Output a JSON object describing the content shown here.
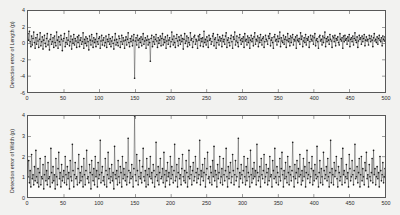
{
  "figure": {
    "background_color": "#f2f2f0",
    "series_color": "#1a1a1a",
    "axis_color": "#585858"
  },
  "chart_data": [
    {
      "type": "line",
      "title": "",
      "subtitle": "",
      "xlabel": "",
      "ylabel": "Detection error of Length (p)",
      "xlim": [
        0,
        500
      ],
      "ylim": [
        -6,
        4
      ],
      "xticks": [
        0,
        50,
        100,
        150,
        200,
        250,
        300,
        350,
        400,
        450,
        500
      ],
      "xticklabels": [
        "0",
        "50",
        "100",
        "150",
        "200",
        "250",
        "300",
        "350",
        "400",
        "450",
        "500"
      ],
      "yticks": [
        -6,
        -4,
        -2,
        0,
        2,
        4
      ],
      "yticklabels": [
        "-6",
        "-4",
        "-2",
        "0",
        "2",
        "4"
      ],
      "grid": false,
      "legend": null,
      "marker": "dot",
      "linestyle": "solid",
      "annotations": [
        {
          "text": "deep negative outlier",
          "x": 150,
          "y": -4.3
        },
        {
          "text": "secondary negative outlier",
          "x": 177,
          "y": -2.2
        }
      ],
      "values": [
        1.2,
        0.4,
        1.5,
        0.2,
        -0.4,
        0.9,
        -0.2,
        0.6,
        1.4,
        0.1,
        -0.6,
        0.7,
        -0.1,
        1.1,
        0.3,
        -0.5,
        0.5,
        1.3,
        -0.3,
        0.2,
        0.8,
        -0.7,
        0.4,
        1.0,
        0.0,
        -0.4,
        0.6,
        1.2,
        -0.2,
        0.3,
        -0.8,
        0.5,
        1.1,
        -0.1,
        0.2,
        0.7,
        -0.5,
        0.9,
        0.1,
        -0.3,
        1.4,
        0.4,
        -0.6,
        0.8,
        0.2,
        -0.2,
        1.0,
        0.5,
        -0.9,
        0.3,
        0.6,
        1.2,
        -0.4,
        0.1,
        0.7,
        -0.1,
        0.4,
        1.5,
        -0.3,
        0.2,
        0.9,
        -0.7,
        0.5,
        0.0,
        1.1,
        -0.2,
        0.6,
        0.3,
        -0.5,
        0.8,
        0.1,
        1.0,
        -0.4,
        0.4,
        0.7,
        -0.1,
        0.2,
        1.3,
        -0.6,
        0.5,
        0.0,
        0.8,
        -0.3,
        0.6,
        0.2,
        -0.8,
        0.9,
        0.4,
        -0.2,
        1.1,
        0.3,
        -0.5,
        0.7,
        0.1,
        0.5,
        -0.4,
        1.2,
        0.2,
        -0.1,
        0.6,
        0.8,
        -0.6,
        0.3,
        1.0,
        -0.2,
        0.4,
        0.7,
        -0.3,
        0.1,
        0.9,
        -0.5,
        0.5,
        0.2,
        1.1,
        -0.1,
        0.6,
        -0.4,
        0.3,
        0.8,
        0.0,
        -0.7,
        0.4,
        1.2,
        -0.2,
        0.5,
        0.1,
        -0.3,
        0.9,
        0.6,
        -0.5,
        0.2,
        1.0,
        -0.1,
        0.7,
        0.3,
        -0.6,
        0.4,
        0.8,
        -0.2,
        0.5,
        1.3,
        0.1,
        -0.4,
        0.6,
        0.2,
        0.9,
        -0.3,
        0.4,
        1.1,
        -4.3,
        0.3,
        0.7,
        -0.2,
        1.0,
        0.4,
        -0.5,
        0.6,
        0.1,
        0.8,
        -0.3,
        0.5,
        1.2,
        -0.1,
        0.3,
        0.7,
        -0.6,
        0.4,
        0.9,
        -0.2,
        0.5,
        0.1,
        -2.2,
        0.6,
        1.0,
        -0.4,
        0.2,
        0.8,
        -0.1,
        0.5,
        1.1,
        0.3,
        -0.5,
        0.7,
        0.0,
        0.4,
        0.9,
        -0.3,
        0.6,
        1.2,
        -0.2,
        0.5,
        0.1,
        0.8,
        -0.6,
        0.3,
        1.0,
        -0.1,
        0.4,
        0.7,
        -0.4,
        0.2,
        1.4,
        0.5,
        -0.2,
        0.9,
        0.1,
        -0.5,
        0.6,
        1.1,
        0.3,
        -0.3,
        0.8,
        0.4,
        -0.1,
        1.0,
        0.2,
        0.6,
        -0.7,
        0.5,
        1.2,
        0.0,
        0.3,
        0.9,
        -0.4,
        0.7,
        0.1,
        -0.2,
        1.3,
        0.4,
        0.6,
        -0.5,
        0.2,
        0.8,
        1.0,
        -0.1,
        0.5,
        0.3,
        -0.6,
        0.9,
        0.4,
        1.1,
        -0.3,
        0.6,
        0.2,
        0.7,
        -0.4,
        1.5,
        0.1,
        0.5,
        -0.2,
        0.8,
        0.3,
        -0.5,
        1.0,
        0.4,
        0.6,
        -0.1,
        0.2,
        0.9,
        1.2,
        -0.3,
        0.5,
        0.7,
        -0.6,
        0.1,
        1.1,
        0.4,
        -0.2,
        0.8,
        0.3,
        0.6,
        -0.4,
        1.0,
        0.2,
        0.5,
        -0.1,
        0.9,
        1.3,
        -0.5,
        0.4,
        0.7,
        0.1,
        -0.3,
        0.6,
        1.0,
        0.2,
        -0.6,
        0.8,
        0.5,
        1.4,
        -0.2,
        0.3,
        0.9,
        0.1,
        -0.4,
        0.7,
        1.1,
        0.4,
        -0.1,
        0.6,
        0.2,
        0.8,
        -0.5,
        1.2,
        0.3,
        0.5,
        -0.2,
        0.9,
        0.1,
        0.7,
        -0.6,
        0.4,
        1.0,
        0.2,
        0.6,
        -0.3,
        0.8,
        1.3,
        -0.1,
        0.5,
        0.3,
        0.9,
        -0.4,
        0.7,
        0.1,
        1.1,
        0.4,
        -0.2,
        0.6,
        0.8,
        -0.5,
        0.2,
        1.0,
        0.5,
        0.3,
        -0.1,
        0.9,
        0.6,
        1.2,
        -0.3,
        0.4,
        0.7,
        0.1,
        -0.6,
        0.8,
        1.1,
        0.3,
        0.5,
        -0.2,
        0.9,
        0.2,
        0.6,
        1.4,
        -0.4,
        0.7,
        0.3,
        0.1,
        1.0,
        -0.1,
        0.5,
        0.8,
        -0.5,
        0.4,
        1.2,
        0.2,
        0.6,
        -0.3,
        0.9,
        0.1,
        0.7,
        1.1,
        -0.2,
        0.5,
        0.3,
        0.8,
        -0.6,
        1.0,
        0.4,
        0.2,
        0.6,
        -0.1,
        1.3,
        0.5,
        0.9,
        -0.4,
        0.3,
        0.7,
        0.1,
        1.1,
        -0.2,
        0.6,
        0.4,
        0.8,
        -0.5,
        0.2,
        1.0,
        0.5,
        0.3,
        0.9,
        -0.1,
        0.7,
        1.2,
        -0.3,
        0.4,
        0.6,
        0.2,
        -0.6,
        0.8,
        1.0,
        0.3,
        0.5,
        -0.2,
        0.9,
        0.1,
        0.7,
        1.4,
        -0.4,
        0.6,
        0.2,
        0.8,
        0.4,
        -0.1,
        1.1,
        0.5,
        0.3,
        -0.5,
        0.9,
        0.7,
        0.2,
        1.0,
        -0.3,
        0.6,
        0.4,
        0.8,
        0.1,
        -0.2,
        1.2,
        0.5,
        0.3,
        0.7,
        -0.6,
        0.9,
        0.2,
        1.0,
        0.4,
        0.6,
        -0.1,
        0.8,
        0.3,
        1.1,
        -0.4,
        0.5,
        0.7,
        0.2,
        0.9,
        -0.2,
        0.6,
        1.3,
        0.4,
        0.1,
        0.8,
        -0.5,
        0.3,
        1.0,
        0.5,
        0.7,
        -0.1,
        0.9,
        0.2,
        0.6,
        1.1,
        -0.3,
        0.4,
        0.8,
        0.3,
        0.5,
        -0.2,
        1.0,
        0.6,
        0.2,
        0.9,
        0.4,
        -0.4,
        0.7,
        1.2,
        0.3,
        0.5,
        0.1,
        0.8,
        -0.1,
        0.6,
        1.0,
        0.4,
        0.2,
        0.7,
        -0.3,
        0.9,
        0.5,
        0.3,
        0.8
      ]
    },
    {
      "type": "line",
      "title": "",
      "subtitle": "",
      "xlabel": "",
      "ylabel": "Detection error of Width (p)",
      "xlim": [
        0,
        500
      ],
      "ylim": [
        0,
        4
      ],
      "xticks": [
        0,
        50,
        100,
        150,
        200,
        250,
        300,
        350,
        400,
        450,
        500
      ],
      "xticklabels": [
        "0",
        "50",
        "100",
        "150",
        "200",
        "250",
        "300",
        "350",
        "400",
        "450",
        "500"
      ],
      "yticks": [
        0,
        1,
        2,
        3,
        4
      ],
      "yticklabels": [
        "0",
        "1",
        "2",
        "3",
        "4"
      ],
      "grid": false,
      "legend": null,
      "marker": "dot",
      "linestyle": "solid",
      "annotations": [
        {
          "text": "tall positive spike",
          "x": 150,
          "y": 4.2
        }
      ],
      "values": [
        1.0,
        1.8,
        0.7,
        1.3,
        0.5,
        2.1,
        0.9,
        1.1,
        0.6,
        1.5,
        0.8,
        2.3,
        1.0,
        0.7,
        1.4,
        0.5,
        1.2,
        1.9,
        0.6,
        1.0,
        0.9,
        1.6,
        0.4,
        1.1,
        2.0,
        0.8,
        1.3,
        0.6,
        1.7,
        0.9,
        1.0,
        0.5,
        2.4,
        1.2,
        0.7,
        1.5,
        0.8,
        1.1,
        0.4,
        1.9,
        1.0,
        0.6,
        1.4,
        2.2,
        0.9,
        1.2,
        0.5,
        1.6,
        0.8,
        1.0,
        1.3,
        0.7,
        2.0,
        1.1,
        0.6,
        1.5,
        0.9,
        1.2,
        0.4,
        1.8,
        1.0,
        0.8,
        2.6,
        1.3,
        0.5,
        1.1,
        1.7,
        0.9,
        1.0,
        0.6,
        1.4,
        2.1,
        0.7,
        1.2,
        0.8,
        1.5,
        1.0,
        0.5,
        1.9,
        1.1,
        0.6,
        1.3,
        2.3,
        0.9,
        1.0,
        0.7,
        1.6,
        1.2,
        0.4,
        1.8,
        1.1,
        0.8,
        1.4,
        0.6,
        2.0,
        1.0,
        1.3,
        0.5,
        1.7,
        0.9,
        1.1,
        2.8,
        0.7,
        1.2,
        1.5,
        0.8,
        1.0,
        0.6,
        1.9,
        1.3,
        0.5,
        1.1,
        2.2,
        0.9,
        1.4,
        0.7,
        1.0,
        1.6,
        0.8,
        1.2,
        0.4,
        2.5,
        1.1,
        0.9,
        1.3,
        0.6,
        1.8,
        1.0,
        0.7,
        1.5,
        1.2,
        0.5,
        2.0,
        0.9,
        1.4,
        1.1,
        0.8,
        1.7,
        0.6,
        1.0,
        2.9,
        1.3,
        0.7,
        1.2,
        0.9,
        1.6,
        1.0,
        0.5,
        1.4,
        4.2,
        1.1,
        0.8,
        2.1,
        1.3,
        0.6,
        1.0,
        1.8,
        0.9,
        1.2,
        0.7,
        1.5,
        2.4,
        1.0,
        0.8,
        1.3,
        0.5,
        1.9,
        1.1,
        0.6,
        1.4,
        1.0,
        2.0,
        0.9,
        1.2,
        0.7,
        1.6,
        1.3,
        0.5,
        1.0,
        2.7,
        1.1,
        0.8,
        1.5,
        0.6,
        1.2,
        1.9,
        0.9,
        1.0,
        1.4,
        0.7,
        2.2,
        1.1,
        0.5,
        1.3,
        0.8,
        1.7,
        1.0,
        1.2,
        0.6,
        2.0,
        0.9,
        1.5,
        1.1,
        0.7,
        1.3,
        2.6,
        0.8,
        1.0,
        1.6,
        0.5,
        1.2,
        1.9,
        0.9,
        1.1,
        0.6,
        1.4,
        2.1,
        1.0,
        0.8,
        1.3,
        0.7,
        1.8,
        1.2,
        0.5,
        1.0,
        2.3,
        0.9,
        1.5,
        1.1,
        0.6,
        1.3,
        1.7,
        0.8,
        1.0,
        2.0,
        1.2,
        0.7,
        1.4,
        0.9,
        1.1,
        2.8,
        0.6,
        1.3,
        1.0,
        1.6,
        0.8,
        1.2,
        1.9,
        0.5,
        1.1,
        1.4,
        2.2,
        0.9,
        1.0,
        0.7,
        1.5,
        1.2,
        0.6,
        1.8,
        1.0,
        2.5,
        0.8,
        1.3,
        1.1,
        0.5,
        1.6,
        0.9,
        1.2,
        2.0,
        0.7,
        1.0,
        1.4,
        0.6,
        1.9,
        1.1,
        0.8,
        1.3,
        2.4,
        1.0,
        0.5,
        1.5,
        0.9,
        1.2,
        1.7,
        0.7,
        1.0,
        2.1,
        1.3,
        0.6,
        1.1,
        1.8,
        0.8,
        1.0,
        1.4,
        2.9,
        0.5,
        1.2,
        0.9,
        1.6,
        1.1,
        0.7,
        1.3,
        2.0,
        1.0,
        0.6,
        1.5,
        0.8,
        1.9,
        1.2,
        1.0,
        0.5,
        2.3,
        1.1,
        0.7,
        1.4,
        0.9,
        1.7,
        1.0,
        1.3,
        0.6,
        2.6,
        1.2,
        0.8,
        1.0,
        1.5,
        0.5,
        1.9,
        1.1,
        0.9,
        1.3,
        2.1,
        0.7,
        1.0,
        1.6,
        1.2,
        0.6,
        1.4,
        0.8,
        2.0,
        1.0,
        1.1,
        0.5,
        1.8,
        1.3,
        0.9,
        2.4,
        1.0,
        0.7,
        1.5,
        1.2,
        0.6,
        1.0,
        1.9,
        0.8,
        1.4,
        2.2,
        1.1,
        0.5,
        1.3,
        0.9,
        1.7,
        1.0,
        0.7,
        2.0,
        1.2,
        0.6,
        1.5,
        1.1,
        0.8,
        1.3,
        2.7,
        1.0,
        0.5,
        1.6,
        0.9,
        1.2,
        1.8,
        0.7,
        1.4,
        1.0,
        2.1,
        1.1,
        0.6,
        1.3,
        0.8,
        1.9,
        1.0,
        1.5,
        0.5,
        1.2,
        2.3,
        0.9,
        1.1,
        1.7,
        0.7,
        1.0,
        1.4,
        2.0,
        0.6,
        1.3,
        0.8,
        1.6,
        1.1,
        0.9,
        2.5,
        1.0,
        0.5,
        1.2,
        1.8,
        0.7,
        1.4,
        1.0,
        0.6,
        2.2,
        1.3,
        0.9,
        1.1,
        1.5,
        0.8,
        1.9,
        1.0,
        0.5,
        1.2,
        2.8,
        0.7,
        1.4,
        1.1,
        0.6,
        1.7,
        1.0,
        1.3,
        2.0,
        0.9,
        0.5,
        1.5,
        1.2,
        0.8,
        1.0,
        1.9,
        0.6,
        2.4,
        1.1,
        1.3,
        0.7,
        1.0,
        1.6,
        0.9,
        1.2,
        0.5,
        2.1,
        1.4,
        0.8,
        1.0,
        1.8,
        1.1,
        0.6,
        1.3,
        2.6,
        0.9,
        1.0,
        1.5,
        0.7,
        1.2,
        1.9,
        0.5,
        1.1,
        2.0,
        0.8,
        1.4,
        1.0,
        0.6,
        1.7,
        1.3,
        2.2,
        0.9,
        1.1,
        0.5,
        1.6,
        1.0,
        0.8,
        1.2,
        1.9,
        0.7,
        2.3,
        1.1,
        1.4,
        0.6,
        1.0,
        1.5,
        0.9,
        1.2,
        0.5,
        2.0,
        1.3,
        0.8,
        1.1,
        1.7,
        0.7,
        1.0,
        1.4
      ]
    }
  ]
}
